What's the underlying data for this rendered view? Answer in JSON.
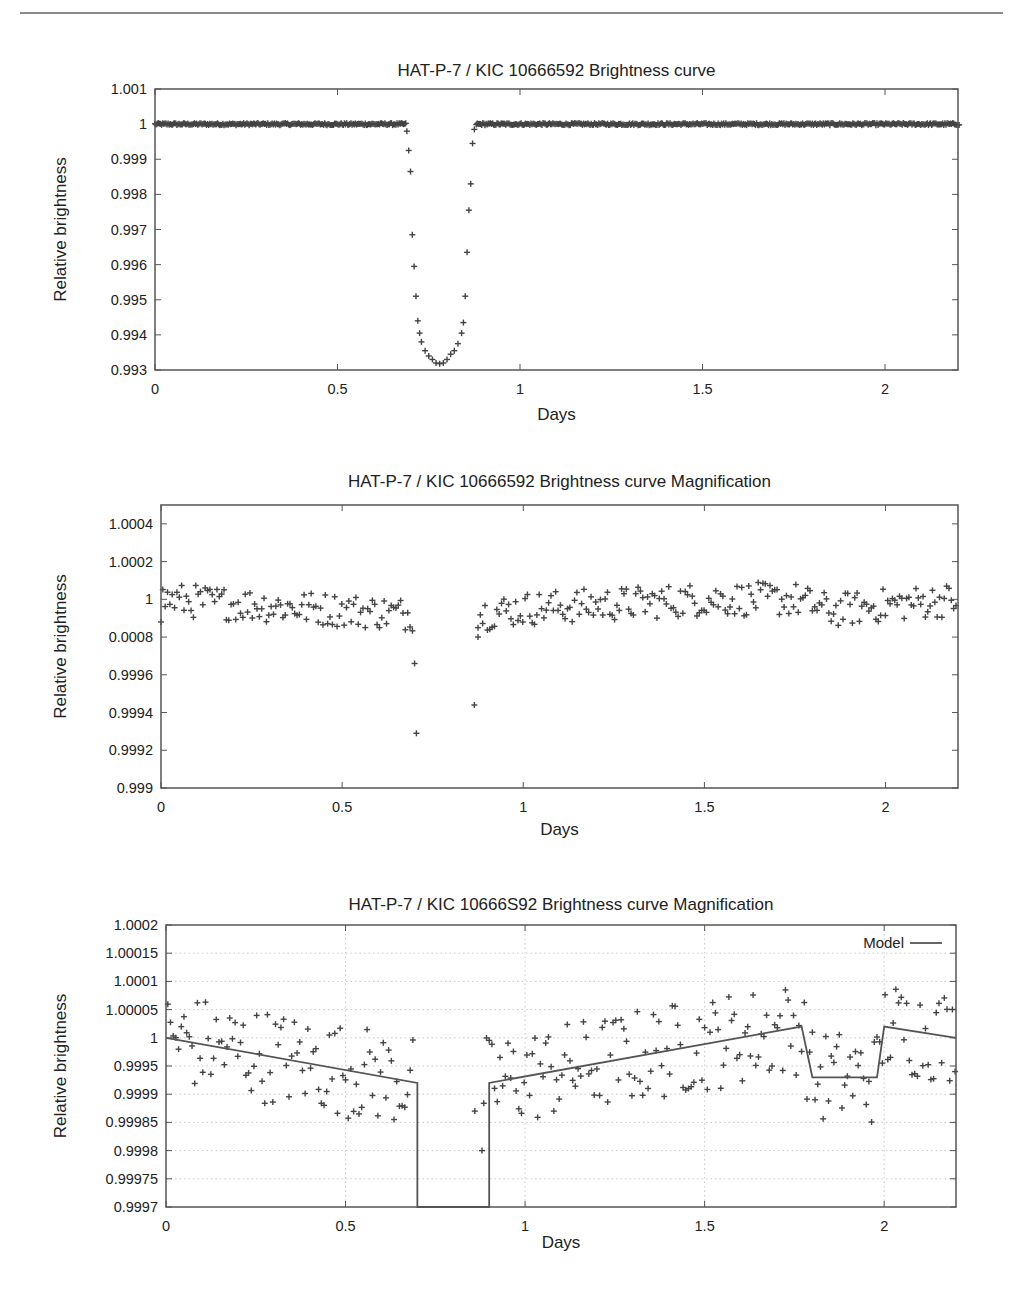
{
  "chart_data": [
    {
      "type": "scatter",
      "title": "HAT-P-7 / KIC 10666592 Brightness curve",
      "xlabel": "Days",
      "ylabel": "Relative brightness",
      "xlim": [
        0,
        2.2
      ],
      "ylim": [
        0.993,
        1.001
      ],
      "xticks": [
        0,
        0.5,
        1,
        1.5,
        2
      ],
      "xtick_labels": [
        "0",
        "0.5",
        "1",
        "1.5",
        "2"
      ],
      "yticks": [
        1.001,
        1,
        0.999,
        0.998,
        0.997,
        0.996,
        0.995,
        0.994,
        0.993
      ],
      "ytick_labels": [
        "1.001",
        "1",
        "0.999",
        "0.998",
        "0.997",
        "0.996",
        "0.995",
        "0.994",
        "0.993"
      ],
      "grid": false,
      "series": [
        {
          "name": "observations",
          "baseline": {
            "x_ranges": [
              [
                0,
                0.69
              ],
              [
                0.88,
                2.2
              ]
            ],
            "y": 1.0,
            "noise": 6e-05,
            "step": 0.006
          },
          "transit_points": {
            "x": [
              0.69,
              0.695,
              0.7,
              0.705,
              0.71,
              0.715,
              0.72,
              0.725,
              0.73,
              0.74,
              0.75,
              0.76,
              0.77,
              0.78,
              0.79,
              0.8,
              0.81,
              0.82,
              0.83,
              0.84,
              0.845,
              0.85,
              0.855,
              0.86,
              0.865,
              0.87,
              0.875
            ],
            "y": [
              0.9998,
              0.99925,
              0.99865,
              0.99685,
              0.99595,
              0.9951,
              0.9944,
              0.99405,
              0.9938,
              0.99355,
              0.9934,
              0.9933,
              0.9932,
              0.99318,
              0.9932,
              0.9933,
              0.99345,
              0.99355,
              0.99375,
              0.99405,
              0.99435,
              0.9951,
              0.99635,
              0.99755,
              0.9983,
              0.99945,
              0.99985
            ]
          }
        }
      ]
    },
    {
      "type": "scatter",
      "title": "HAT-P-7 / KIC 10666592 Brightness curve Magnification",
      "xlabel": "Days",
      "ylabel": "Relative brightness",
      "xlim": [
        0,
        2.2
      ],
      "ylim": [
        0.999,
        1.0005
      ],
      "xticks": [
        0,
        0.5,
        1,
        1.5,
        2
      ],
      "xtick_labels": [
        "0",
        "0.5",
        "1",
        "1.5",
        "2"
      ],
      "yticks": [
        1.0004,
        1.0002,
        1.0,
        0.9998,
        0.9996,
        0.9994,
        0.9992,
        0.999
      ],
      "ytick_labels": [
        "1.0004",
        "1.0002",
        "1",
        "0.0008",
        "0.9996",
        "0.9994",
        "0.9992",
        "0.999"
      ],
      "grid": false,
      "series": [
        {
          "name": "observations",
          "band": {
            "x_ranges": [
              [
                0,
                0.7
              ],
              [
                0.87,
                2.2
              ]
            ],
            "noise": 9e-05,
            "step": 0.0065,
            "trend_x": [
              0,
              0.35,
              0.7,
              0.87,
              1.0,
              1.5,
              1.75,
              1.85,
              2.0,
              2.2
            ],
            "trend_y": [
              1.0,
              0.99996,
              0.99992,
              0.99992,
              0.99995,
              1.0,
              1.0,
              0.99994,
              0.99997,
              1.0
            ]
          },
          "outliers": {
            "x": [
              0.0,
              0.7,
              0.705,
              0.865,
              0.875
            ],
            "y": [
              0.99988,
              0.99966,
              0.99929,
              0.99944,
              0.9998
            ]
          }
        }
      ]
    },
    {
      "type": "scatter",
      "title": "HAT-P-7 / KIC 10666S92 Brightness curve Magnification",
      "xlabel": "Days",
      "ylabel": "Relative brightness",
      "xlim": [
        0,
        2.2
      ],
      "ylim": [
        0.9997,
        1.0002
      ],
      "xticks": [
        0,
        0.5,
        1,
        1.5,
        2
      ],
      "xtick_labels": [
        "0",
        "0.5",
        "1",
        "1.5",
        "2"
      ],
      "yticks": [
        1.0002,
        1.00015,
        1.0001,
        1.00005,
        1,
        0.99995,
        0.9999,
        0.99985,
        0.9998,
        0.99975,
        0.9997
      ],
      "ytick_labels": [
        "1.0002",
        "1.00015",
        "1.0001",
        "1.00005",
        "1",
        "0.9995",
        "0.9999",
        "0.99985",
        "0.9998",
        "0.99975",
        "0.9997"
      ],
      "grid": true,
      "legend": {
        "position": "top-right",
        "entries": [
          "Model"
        ]
      },
      "series": [
        {
          "name": "observations",
          "band": {
            "x_ranges": [
              [
                0,
                0.69
              ],
              [
                0.88,
                2.2
              ]
            ],
            "noise": 8.5e-05,
            "step": 0.0075,
            "trend_x": [
              0,
              0.7,
              0.9,
              1.77,
              1.8,
              1.98,
              2.0,
              2.2
            ],
            "trend_y": [
              1.0,
              0.99992,
              0.99992,
              1.00002,
              0.99993,
              0.99993,
              1.00002,
              1.0
            ]
          },
          "outliers": {
            "x": [
              0.88,
              0.86
            ],
            "y": [
              0.9998,
              0.99987
            ]
          }
        },
        {
          "name": "Model",
          "type": "line",
          "x": [
            0,
            0.7,
            0.7,
            0.9,
            0.9,
            1.77,
            1.8,
            1.98,
            2.0,
            2.2
          ],
          "y": [
            1.0,
            0.99992,
            0.9997,
            0.9997,
            0.99992,
            1.00002,
            0.99993,
            0.99993,
            1.00002,
            1.0
          ]
        }
      ]
    }
  ],
  "layout_boxes": [
    {
      "left": 155,
      "top": 89,
      "right": 958,
      "bottom": 370,
      "title_y": 76,
      "xlabel_y": 424
    },
    {
      "left": 161,
      "top": 505,
      "right": 958,
      "bottom": 788,
      "title_y": 487,
      "xlabel_y": 839
    },
    {
      "left": 166,
      "top": 925,
      "right": 956,
      "bottom": 1207,
      "title_y": 910,
      "xlabel_y": 1252
    }
  ]
}
